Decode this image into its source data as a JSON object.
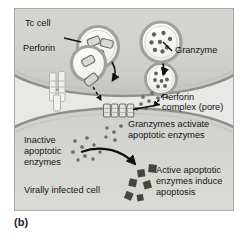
{
  "figure": {
    "caption": "(b)",
    "panel_bg": "#e8e8e6",
    "panel_border": "#a9a9a6",
    "cell_fill_top": "#d2d2cf",
    "cell_fill_bottom": "#d2d2cf",
    "membrane_stroke": "#8f8f8c",
    "vesicle_fill": "#f4f4f2",
    "granule_color": "#6b6b68",
    "active_enzyme_color": "#4a4a48",
    "text_color": "#141414"
  },
  "labels": {
    "tc_cell": "Tc cell",
    "perforin": "Perforin",
    "granzyme": "Granzyme",
    "perforin_complex_line1": "Perforin",
    "perforin_complex_line2": "complex (pore)",
    "granzymes_activate_line1": "Granzymes activate",
    "granzymes_activate_line2": "apoptotic enzymes",
    "inactive_line1": "Inactive",
    "inactive_line2": "apoptotic",
    "inactive_line3": "enzymes",
    "active_line1": "Active apoptotic",
    "active_line2": "enzymes induce",
    "active_line3": "apoptosis",
    "virally_infected_cell": "Virally infected cell"
  },
  "icons": {
    "tc_cell_body": "tc-cell-body",
    "infected_cell_body": "infected-cell-body",
    "perforin_vesicle": "perforin-vesicle",
    "perforin_vesicle_fusing": "perforin-vesicle-fusing",
    "granzyme_vesicle": "granzyme-vesicle",
    "granzyme_vesicle_fusing": "granzyme-vesicle-fusing",
    "pore_complex": "perforin-pore-complex",
    "tcr_receptor": "tcr-receptor",
    "perforin_monomer": "perforin-monomer",
    "granzyme_granule": "granzyme-granule",
    "inactive_enzyme_dot": "inactive-enzyme-dot",
    "active_enzyme_square": "active-enzyme-square",
    "arrow": "arrow"
  },
  "counts": {
    "perforin_monomers_in_vesicle": 3,
    "granzyme_granules_in_vesicle": 8,
    "pore_subunits": 4,
    "active_enzyme_squares": 6
  }
}
